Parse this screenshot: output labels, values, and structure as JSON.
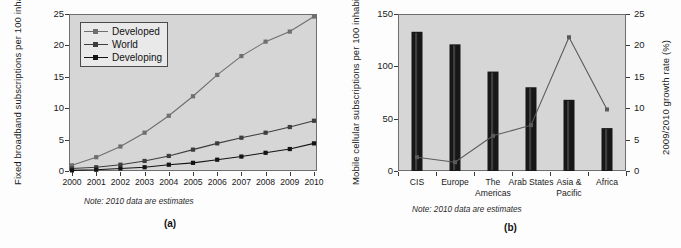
{
  "figure": {
    "background": "#fdfdfd",
    "plot_background": "#d6d6d6",
    "axis_color": "#3a3a3a"
  },
  "panel_a": {
    "label": "(a)",
    "note": "Note: 2010 data are estimates",
    "ylabel": "Fixed broadband subscriptions per 100 inhabitants",
    "yticks": [
      "0",
      "5",
      "10",
      "15",
      "20",
      "25"
    ],
    "xticks": [
      "2000",
      "2001",
      "2002",
      "2003",
      "2004",
      "2005",
      "2006",
      "2007",
      "2008",
      "2009",
      "2010"
    ],
    "legend": [
      {
        "label": "Developed",
        "color": "#6f6f6f"
      },
      {
        "label": "World",
        "color": "#3d3d3d"
      },
      {
        "label": "Developing",
        "color": "#141414"
      }
    ],
    "chart_data": {
      "type": "line",
      "title": "",
      "xlabel": "",
      "ylabel": "Fixed broadband subscriptions per 100 inhabitants",
      "x": [
        2000,
        2001,
        2002,
        2003,
        2004,
        2005,
        2006,
        2007,
        2008,
        2009,
        2010
      ],
      "xlim": [
        2000,
        2010
      ],
      "ylim": [
        0,
        25
      ],
      "grid": false,
      "legend_position": "upper-left",
      "note": "Note: 2010 data are estimates",
      "series": [
        {
          "name": "Developed",
          "color": "#6f6f6f",
          "values": [
            0.9,
            2.2,
            3.9,
            6.1,
            8.8,
            11.9,
            15.3,
            18.3,
            20.6,
            22.2,
            24.6
          ]
        },
        {
          "name": "World",
          "color": "#3d3d3d",
          "values": [
            0.4,
            0.6,
            1.0,
            1.6,
            2.4,
            3.4,
            4.4,
            5.3,
            6.1,
            7.0,
            8.0
          ]
        },
        {
          "name": "Developing",
          "color": "#141414",
          "values": [
            0.1,
            0.2,
            0.4,
            0.6,
            1.0,
            1.3,
            1.8,
            2.3,
            2.9,
            3.5,
            4.4
          ]
        }
      ]
    }
  },
  "panel_b": {
    "label": "(b)",
    "note": "Note: 2010 data are estimates",
    "ylabel_left": "Mobile cellular subscriptions per 100 inhabitants, 2010",
    "ylabel_right": "2009/2010 growth rate (%)",
    "yticks_left": [
      "0",
      "50",
      "100",
      "150"
    ],
    "yticks_right": [
      "0",
      "5",
      "10",
      "15",
      "20",
      "25"
    ],
    "categories": [
      "CIS",
      "Europe",
      "The Americas",
      "Arab States",
      "Asia & Pacific",
      "Africa"
    ],
    "bar_color": "#171717",
    "line_color": "#5a5a5a",
    "chart_data": {
      "type": "bar",
      "title": "",
      "xlabel": "",
      "ylabel": "Mobile cellular subscriptions per 100 inhabitants, 2010",
      "ylabel_secondary": "2009/2010 growth rate (%)",
      "categories": [
        "CIS",
        "Europe",
        "The Americas",
        "Arab States",
        "Asia & Pacific",
        "Africa"
      ],
      "ylim": [
        0,
        150
      ],
      "ylim_secondary": [
        0,
        25
      ],
      "grid": false,
      "note": "Note: 2010 data are estimates",
      "series": [
        {
          "name": "Mobile cellular subscriptions per 100 inhabitants, 2010",
          "type": "bar",
          "axis": "left",
          "color": "#171717",
          "values": [
            133,
            121,
            95,
            80,
            68,
            41
          ]
        },
        {
          "name": "2009/2010 growth rate (%)",
          "type": "line",
          "axis": "right",
          "color": "#5a5a5a",
          "values": [
            2.2,
            1.4,
            5.6,
            7.3,
            21.3,
            9.8
          ]
        }
      ]
    }
  }
}
